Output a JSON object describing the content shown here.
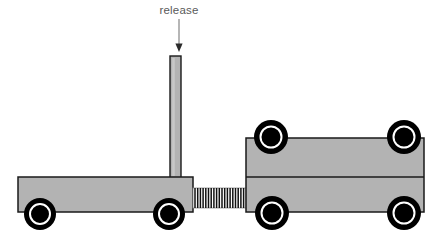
{
  "diagram": {
    "type": "physics-mechanics-illustration",
    "background_color": "#ffffff",
    "annotation": {
      "label": "release",
      "label_color": "#595959",
      "arrow_color": "#7a7a7a",
      "arrow_points_to": "release-post-top",
      "arrow_direction": "down"
    },
    "colors": {
      "body_fill": "#b3b3b3",
      "outline": "#1a1a1a",
      "wheel_tire": "#000000",
      "wheel_rim": "#ffffff",
      "wheel_hub": "#000000",
      "spring_stroke": "#000000",
      "post_fill": "#b3b3b3"
    },
    "parts": [
      {
        "name": "release-post",
        "kind": "vertical-rod",
        "x": 170,
        "y": 56,
        "width": 11,
        "height": 122
      },
      {
        "name": "left-cart-body",
        "kind": "flatbed-platform",
        "x": 18,
        "y": 177,
        "width": 175,
        "height": 35
      },
      {
        "name": "spring",
        "kind": "compressed-coil-spring",
        "x": 193,
        "y": 188,
        "width": 53,
        "height": 20,
        "coils": 19
      },
      {
        "name": "right-cart-body",
        "kind": "block-cart",
        "x": 246,
        "y": 138,
        "width": 178,
        "height": 74,
        "divider_y": 177
      }
    ],
    "wheels": [
      {
        "name": "left-cart-rear-wheel",
        "cx": 40,
        "cy": 214,
        "r_tire": 16,
        "r_rim": 10,
        "r_hub": 8
      },
      {
        "name": "left-cart-front-wheel",
        "cx": 169,
        "cy": 214,
        "r_tire": 16,
        "r_rim": 10,
        "r_hub": 8
      },
      {
        "name": "right-cart-top-left-wheel",
        "cx": 271,
        "cy": 137,
        "r_tire": 17,
        "r_rim": 10.5,
        "r_hub": 8.5
      },
      {
        "name": "right-cart-top-right-wheel",
        "cx": 404,
        "cy": 137,
        "r_tire": 17,
        "r_rim": 10.5,
        "r_hub": 8.5
      },
      {
        "name": "right-cart-bottom-left-wheel",
        "cx": 272,
        "cy": 213,
        "r_tire": 17,
        "r_rim": 10.5,
        "r_hub": 8.5
      },
      {
        "name": "right-cart-bottom-right-wheel",
        "cx": 404,
        "cy": 213,
        "r_tire": 17,
        "r_rim": 10.5,
        "r_hub": 8.5
      }
    ]
  }
}
